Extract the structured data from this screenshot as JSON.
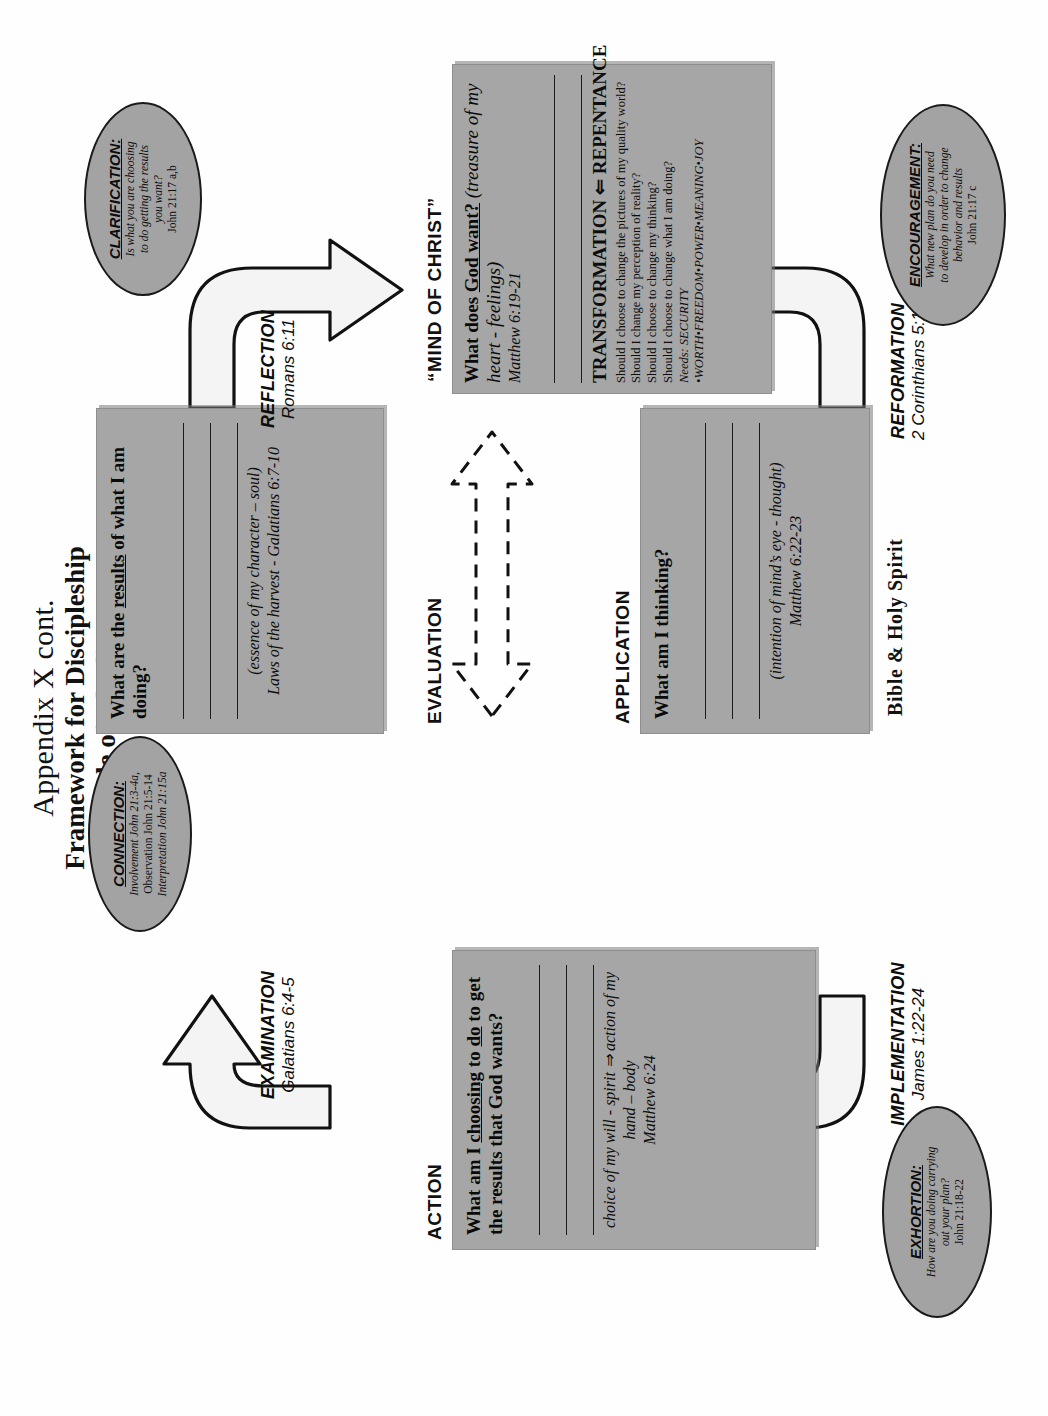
{
  "page": {
    "title_line1": "Appendix X cont.",
    "title_line2": "Framework for Discipleship",
    "title_line3": "Cycle of Obedience"
  },
  "captions": {
    "action": "ACTION",
    "evaluation": "EVALUATION",
    "application": "APPLICATION",
    "mind_of_christ": "“MIND OF CHRIST”",
    "bible_holy_spirit": "Bible & Holy Spirit"
  },
  "boxes": {
    "action": {
      "question": "What am I choosing to do to get the results that God wants?",
      "question_pre": "What am I ",
      "question_u1": "choosing",
      "question_mid": " to ",
      "question_u2": "do",
      "question_post": " to get the results that God wants?",
      "note_line1": "choice of my will - spirit ⇒ action of my hand – body",
      "note_line2": "Matthew 6:24",
      "rule_count": 3
    },
    "evaluation": {
      "question_pre": "What are the ",
      "question_u1": "results",
      "question_post": " of what I am doing?",
      "note_line1": "(essence of my character – soul)",
      "note_line2": "Laws of the harvest - Galatians 6:7-10",
      "rule_count": 3
    },
    "application": {
      "question": "What am I thinking?",
      "note_line1": "(intention of mind’s eye - thought)",
      "note_line2": "Matthew 6:22-23",
      "rule_count": 3
    },
    "mind_of_christ": {
      "question_pre": "What does ",
      "question_u1": "God want?",
      "question_post": "  (treasure of my heart - feelings)",
      "verse": "Matthew 6:19-21",
      "rule_count": 2,
      "transformation_heading": "TRANSFORMATION ⇐ REPENTANCE",
      "bullets": [
        "Should I choose to change the pictures of my quality world?",
        "Should I change my perception of reality?",
        "Should I choose to change my thinking?",
        "Should I choose to change what I am doing?"
      ],
      "needs": "Needs: SECURITY •WORTH•FREEDOM•POWER•MEANING•JOY"
    }
  },
  "process_labels": [
    {
      "name": "EXAMINATION",
      "verse": "Galatians 6:4-5"
    },
    {
      "name": "REFLECTION",
      "verse": "Romans 6:11"
    },
    {
      "name": "REFORMATION",
      "verse": "2 Corinthians 5:17"
    },
    {
      "name": "IMPLEMENTATION",
      "verse": "James 1:22-24"
    }
  ],
  "ovals": [
    {
      "heading": "CONNECTION:",
      "lines": [
        "Involvement John 21:3-4a,",
        "Observation John 21:5-14",
        "Interpretation John 21:15a"
      ]
    },
    {
      "heading": "CLARIFICATION:",
      "lines": [
        "Is what you are choosing",
        "to do getting the results",
        "you want?",
        "John 21:17 a,b"
      ]
    },
    {
      "heading": "EXHORTION:",
      "lines": [
        "How are you doing carrying",
        "out your plan?",
        "John 21:18-22"
      ]
    },
    {
      "heading": "ENCOURAGEMENT:",
      "lines": [
        "What new plan do you need",
        "to develop in order to change",
        "behavior and results",
        "John 21:17 c"
      ]
    }
  ],
  "colors": {
    "box_fill": "#a6a6a6",
    "oval_fill": "#a3a3a3",
    "arrow_fill": "#f2f2f2",
    "stroke": "#111111",
    "page_bg": "#ffffff"
  }
}
